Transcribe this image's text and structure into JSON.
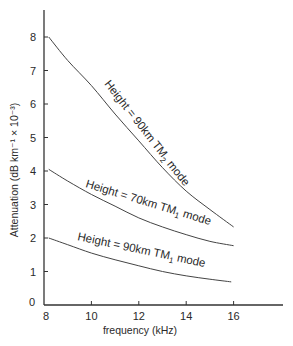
{
  "chart_data": {
    "type": "line",
    "title": "",
    "xlabel": "frequency (kHz)",
    "ylabel": "Attenuation (dB km⁻¹ × 10⁻³)",
    "xlim": [
      8,
      18
    ],
    "ylim": [
      0,
      8.8
    ],
    "xticks": [
      8,
      10,
      12,
      14,
      16
    ],
    "yticks": [
      0,
      1,
      2,
      3,
      4,
      5,
      6,
      7,
      8
    ],
    "grid": false,
    "legend": "none (inline curve labels)",
    "series": [
      {
        "name": "Height = 90km TM2 mode",
        "label_main": "Height = 90km TM",
        "label_sub": "2",
        "label_tail": " mode",
        "x": [
          8.2,
          9,
          10,
          11,
          12,
          13,
          14,
          15,
          16
        ],
        "y": [
          8.0,
          7.3,
          6.55,
          5.7,
          4.9,
          4.1,
          3.4,
          2.85,
          2.33
        ]
      },
      {
        "name": "Height = 70km TM1 mode",
        "label_main": "Height = 70km TM",
        "label_sub": "1",
        "label_tail": " mode",
        "x": [
          8.2,
          9,
          10,
          11,
          12,
          13,
          14,
          15,
          16
        ],
        "y": [
          4.05,
          3.7,
          3.3,
          2.95,
          2.6,
          2.33,
          2.1,
          1.9,
          1.77
        ]
      },
      {
        "name": "Height = 90km TM1 mode",
        "label_main": "Height = 90km TM",
        "label_sub": "1",
        "label_tail": " mode",
        "x": [
          8.2,
          9,
          10,
          11,
          12,
          13,
          14,
          15,
          15.9
        ],
        "y": [
          2.0,
          1.8,
          1.55,
          1.35,
          1.17,
          1.0,
          0.87,
          0.77,
          0.69
        ]
      }
    ]
  },
  "tick_labels": {
    "x": [
      "8",
      "10",
      "12",
      "14",
      "16"
    ],
    "y": [
      "0",
      "1",
      "2",
      "3",
      "4",
      "5",
      "6",
      "7",
      "8"
    ]
  },
  "colors": {
    "line": "#444444",
    "axis": "#333333",
    "text": "#2a2a2a"
  }
}
